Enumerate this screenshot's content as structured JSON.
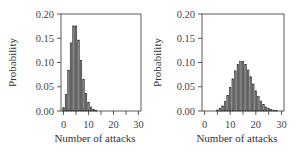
{
  "chart_data": [
    {
      "type": "bar",
      "panel": "left",
      "title": "",
      "xlabel": "Number of attacks",
      "ylabel": "Probability",
      "xlim": [
        -1,
        31
      ],
      "ylim": [
        0,
        0.2
      ],
      "xticks": [
        0,
        10,
        20,
        30
      ],
      "xtick_labels": [
        "0",
        "10",
        "20",
        "30"
      ],
      "yticks": [
        0.0,
        0.05,
        0.1,
        0.15,
        0.2
      ],
      "ytick_labels": [
        "0.00",
        "0.05",
        "0.10",
        "0.15",
        "0.20"
      ],
      "grid": false,
      "legend": null,
      "x": [
        0,
        1,
        2,
        3,
        4,
        5,
        6,
        7,
        8,
        9,
        10,
        11,
        12,
        13,
        14,
        15,
        16,
        17,
        18,
        19,
        20,
        21,
        22,
        23,
        24,
        25,
        26,
        27,
        28,
        29,
        30
      ],
      "values": [
        0.0067,
        0.0337,
        0.0842,
        0.1404,
        0.1755,
        0.1755,
        0.1462,
        0.1044,
        0.0653,
        0.0363,
        0.0181,
        0.0082,
        0.0034,
        0.0013,
        0.0005,
        0.0002,
        0.0,
        0.0,
        0.0,
        0.0,
        0.0,
        0.0,
        0.0,
        0.0,
        0.0,
        0.0,
        0.0,
        0.0,
        0.0,
        0.0,
        0.0
      ]
    },
    {
      "type": "bar",
      "panel": "right",
      "title": "",
      "xlabel": "Number of attacks",
      "ylabel": "Probability",
      "xlim": [
        -1,
        31
      ],
      "ylim": [
        0,
        0.2
      ],
      "xticks": [
        0,
        10,
        20,
        30
      ],
      "xtick_labels": [
        "0",
        "10",
        "20",
        "30"
      ],
      "yticks": [
        0.0,
        0.05,
        0.1,
        0.15,
        0.2
      ],
      "ytick_labels": [
        "0.00",
        "0.05",
        "0.10",
        "0.15",
        "0.20"
      ],
      "grid": false,
      "legend": null,
      "x": [
        0,
        1,
        2,
        3,
        4,
        5,
        6,
        7,
        8,
        9,
        10,
        11,
        12,
        13,
        14,
        15,
        16,
        17,
        18,
        19,
        20,
        21,
        22,
        23,
        24,
        25,
        26,
        27,
        28,
        29,
        30
      ],
      "values": [
        0.0,
        0.0,
        0.0,
        0.0002,
        0.0006,
        0.0019,
        0.0048,
        0.0104,
        0.0194,
        0.0324,
        0.0486,
        0.0663,
        0.0829,
        0.0956,
        0.1024,
        0.1024,
        0.096,
        0.0847,
        0.0706,
        0.0557,
        0.0418,
        0.0299,
        0.0204,
        0.0133,
        0.0083,
        0.005,
        0.0029,
        0.0016,
        0.0009,
        0.0004,
        0.0002
      ]
    }
  ],
  "colors": {
    "bar_fill": "#8a8a8a",
    "bar_edge": "#2a2a2a",
    "axis": "#333333",
    "text": "#444444"
  }
}
